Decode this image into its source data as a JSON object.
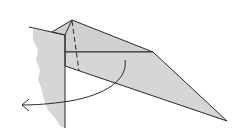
{
  "diagram": {
    "type": "origami-fold-step",
    "colors": {
      "paper_fill": "#d6d6d6",
      "stroke": "#2a2a2a",
      "background": "#ffffff"
    },
    "elements": [
      {
        "name": "torn-paper-edge",
        "role": "left paper region with rough edge"
      },
      {
        "name": "folded-flap",
        "role": "triangular flap extending to the right"
      },
      {
        "name": "valley-fold-dashed-line",
        "role": "dashed fold line"
      },
      {
        "name": "rotate-arrow",
        "role": "curved arrow indicating turning fold to the left/back"
      }
    ]
  }
}
